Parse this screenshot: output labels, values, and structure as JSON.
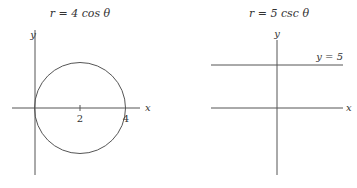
{
  "left_plot": {
    "title": "r = 4 cos θ",
    "x_axis_label": "x",
    "y_axis_label": "y",
    "ticks": [
      "2",
      "4"
    ],
    "curve": "circle centered at (2,0) radius 2"
  },
  "right_plot": {
    "title": "r = 5 csc θ",
    "x_axis_label": "x",
    "y_axis_label": "y",
    "line_label": "y = 5",
    "curve": "horizontal line y = 5"
  },
  "colors": {
    "stroke": "#555555",
    "text": "#333333",
    "background": "#ffffff"
  }
}
